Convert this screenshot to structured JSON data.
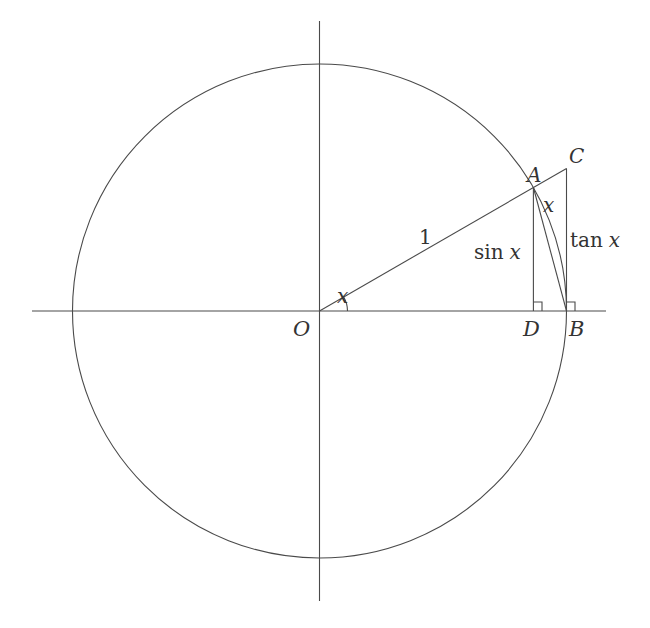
{
  "diagram": {
    "type": "unit-circle-trig",
    "stroke_color": "#4a4a4a",
    "label_color": "#333333",
    "geometry": {
      "center": [
        319.5,
        311
      ],
      "radius": 247,
      "angle_deg": 30,
      "h_axis": [
        32,
        606
      ],
      "v_axis": [
        21,
        601
      ]
    },
    "points": {
      "O": "O",
      "A": "A",
      "B": "B",
      "C": "C",
      "D": "D"
    },
    "labels": {
      "radius": "1",
      "angle": "x",
      "arc": "x",
      "sin": "sin x",
      "sin_fn": "sin",
      "sin_var": "x",
      "tan_fn": "tan",
      "tan_var": "x"
    }
  }
}
